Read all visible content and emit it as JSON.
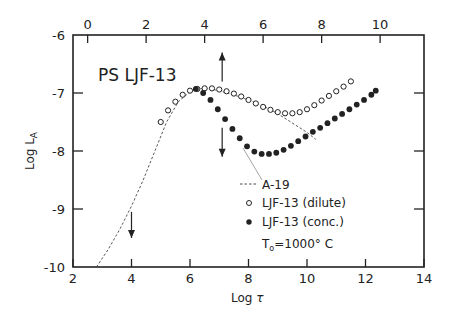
{
  "chart_data": {
    "type": "scatter",
    "title": "PS LJF-13",
    "xlabel": "Log τ",
    "ylabel": "Log L_A",
    "xlim": [
      2,
      14
    ],
    "ylim": [
      -10,
      -6
    ],
    "x_ticks": [
      "2",
      "4",
      "6",
      "8",
      "10",
      "12",
      "14"
    ],
    "y_ticks": [
      "-6",
      "-7",
      "-8",
      "-9",
      "-10"
    ],
    "top_axis": {
      "range": [
        0,
        11.5
      ],
      "ticks": [
        "0",
        "2",
        "4",
        "6",
        "8",
        "10"
      ]
    },
    "grid": false,
    "legend_position": "lower-right inside",
    "annotation": "T₀ = 1000° C",
    "series": [
      {
        "name": "A-19",
        "style": "dashed line",
        "x": [
          2.8,
          3.2,
          3.6,
          4.0,
          4.4,
          4.8,
          5.2,
          5.6,
          6.0,
          6.2,
          6.5,
          6.8,
          7.2,
          7.6,
          8.0,
          8.4,
          8.8,
          9.2,
          9.6,
          10.0,
          10.3
        ],
        "y": [
          -10.0,
          -9.7,
          -9.35,
          -8.95,
          -8.5,
          -8.0,
          -7.5,
          -7.15,
          -6.98,
          -6.93,
          -6.92,
          -6.94,
          -6.99,
          -7.05,
          -7.12,
          -7.2,
          -7.3,
          -7.42,
          -7.55,
          -7.68,
          -7.8
        ]
      },
      {
        "name": "LJF-13 (dilute)",
        "marker": "open circle",
        "x": [
          5.0,
          5.25,
          5.5,
          5.75,
          6.0,
          6.25,
          6.5,
          6.75,
          7.0,
          7.25,
          7.5,
          7.75,
          8.0,
          8.25,
          8.5,
          8.75,
          9.0,
          9.25,
          9.5,
          9.75,
          10.0,
          10.25,
          10.5,
          10.75,
          11.0,
          11.25,
          11.5
        ],
        "y": [
          -7.5,
          -7.3,
          -7.15,
          -7.03,
          -6.96,
          -6.93,
          -6.92,
          -6.92,
          -6.94,
          -6.97,
          -7.01,
          -7.06,
          -7.12,
          -7.18,
          -7.24,
          -7.29,
          -7.33,
          -7.35,
          -7.35,
          -7.33,
          -7.28,
          -7.21,
          -7.13,
          -7.05,
          -6.97,
          -6.89,
          -6.8
        ]
      },
      {
        "name": "LJF-13 (conc.)",
        "marker": "filled circle",
        "x": [
          6.2,
          6.45,
          6.7,
          6.95,
          7.2,
          7.45,
          7.7,
          7.95,
          8.2,
          8.45,
          8.7,
          8.95,
          9.2,
          9.45,
          9.7,
          9.95,
          10.2,
          10.45,
          10.7,
          10.95,
          11.2,
          11.45,
          11.7,
          11.95,
          12.2,
          12.35
        ],
        "y": [
          -6.93,
          -7.0,
          -7.12,
          -7.28,
          -7.45,
          -7.62,
          -7.78,
          -7.92,
          -8.01,
          -8.05,
          -8.05,
          -8.03,
          -7.98,
          -7.91,
          -7.83,
          -7.75,
          -7.67,
          -7.6,
          -7.52,
          -7.44,
          -7.36,
          -7.28,
          -7.2,
          -7.12,
          -7.03,
          -6.96
        ]
      }
    ],
    "arrows": [
      {
        "x": 7.1,
        "from_y": -6.8,
        "to_y": -6.3,
        "direction": "up"
      },
      {
        "x": 7.1,
        "from_y": -7.6,
        "to_y": -8.1,
        "direction": "down"
      },
      {
        "x": 4.0,
        "from_y": -9.05,
        "to_y": -9.5,
        "direction": "down"
      }
    ]
  },
  "legend": {
    "a19": "A-19",
    "dilute": "LJF-13 (dilute)",
    "conc": "LJF-13 (conc.)",
    "temp_prefix": "T",
    "temp_sub": "o",
    "temp_value": "=1000° C"
  },
  "labels": {
    "title": "PS LJF-13",
    "xlabel_main": "Log ",
    "xlabel_sym": "τ",
    "ylabel_main": "Log L",
    "ylabel_sub": "A"
  },
  "colors": {
    "ink": "#222222",
    "background": "#ffffff"
  }
}
